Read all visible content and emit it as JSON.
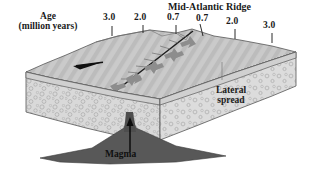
{
  "figure": {
    "title": "Mid-Atlantic Ridge",
    "age_label_line1": "Age",
    "age_label_line2": "(million years)",
    "lateral_label_line1": "Lateral",
    "lateral_label_line2": "spread",
    "magma_label": "Magma"
  },
  "scale": {
    "left_ticks": [
      "3.0",
      "2.0",
      "0.7"
    ],
    "right_ticks": [
      "0.7",
      "2.0",
      "3.0"
    ]
  },
  "icons": {
    "left_plate_arrow": "arrow-left-icon",
    "right_plate_arrow": "arrow-right-icon",
    "magma_arrow": "arrow-up-icon",
    "divergence_arrows": "divergence-arrows-icon",
    "ridge_axis": "ridge-axis-line"
  },
  "colors": {
    "seafloor_top": "#c9c9c9",
    "seafloor_stripe": "#bdbdbd",
    "crust_face": "#d8d8d8",
    "mantle_stipple": "#d2d2d2",
    "magma": "#555555",
    "arrow_black": "#111111",
    "arrow_gray": "#8a8a8a",
    "outline": "#444444",
    "background": "#ffffff"
  }
}
